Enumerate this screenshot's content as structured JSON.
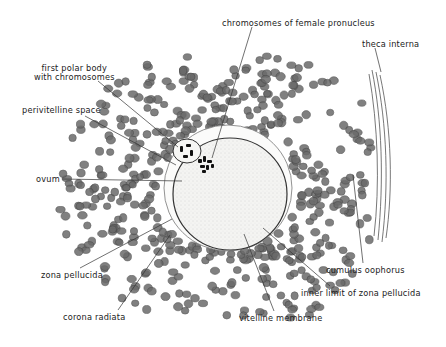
{
  "diagram": {
    "labels": [
      {
        "id": "chromosomes-female-pronucleus",
        "text": "chromosomes of female pronucleus",
        "x": 222,
        "y": 19
      },
      {
        "id": "theca-interna",
        "text": "theca interna",
        "x": 362,
        "y": 40
      },
      {
        "id": "first-polar-body",
        "text": "first polar body\nwith chromosomes",
        "x": 34,
        "y": 64
      },
      {
        "id": "perivitelline-space",
        "text": "perivitelline space",
        "x": 22,
        "y": 106
      },
      {
        "id": "ovum",
        "text": "ovum",
        "x": 36,
        "y": 175
      },
      {
        "id": "zona-pellucida",
        "text": "zona pellucida",
        "x": 41,
        "y": 271
      },
      {
        "id": "cumulus-oophorus",
        "text": "cumulus oophorus",
        "x": 326,
        "y": 266
      },
      {
        "id": "inner-limit-zona",
        "text": "inner limit of zona pellucida",
        "x": 301,
        "y": 289
      },
      {
        "id": "corona-radiata",
        "text": "corona radiata",
        "x": 63,
        "y": 313
      },
      {
        "id": "vitelline-membrane",
        "text": "vitelline membrane",
        "x": 239,
        "y": 314
      }
    ],
    "colors": {
      "ink": "#222222",
      "ovum_fill": "#f3f3f1",
      "cell_fill": "#6a6a6a",
      "cell_outline": "#444444"
    }
  }
}
